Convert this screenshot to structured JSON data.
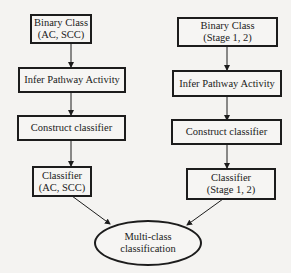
{
  "diagram": {
    "type": "flowchart",
    "left_column": {
      "binary_class": {
        "line1": "Binary Class",
        "line2": "(AC, SCC)"
      },
      "infer": {
        "label": "Infer Pathway Activity"
      },
      "construct": {
        "label": "Construct classifier"
      },
      "classifier": {
        "line1": "Classifier",
        "line2": "(AC, SCC)"
      }
    },
    "right_column": {
      "binary_class": {
        "line1": "Binary Class",
        "line2": "(Stage 1, 2)"
      },
      "infer": {
        "label": "Infer Pathway Activity"
      },
      "construct": {
        "label": "Construct classifier"
      },
      "classifier": {
        "line1": "Classifier",
        "line2": "(Stage 1, 2)"
      }
    },
    "output": {
      "line1": "Multi-class",
      "line2": "classification"
    },
    "edges": [
      {
        "from": "left_binary_class",
        "to": "left_infer"
      },
      {
        "from": "left_infer",
        "to": "left_construct"
      },
      {
        "from": "left_construct",
        "to": "left_classifier"
      },
      {
        "from": "left_classifier",
        "to": "output"
      },
      {
        "from": "right_binary_class",
        "to": "right_infer"
      },
      {
        "from": "right_infer",
        "to": "right_construct"
      },
      {
        "from": "right_construct",
        "to": "right_classifier"
      },
      {
        "from": "right_classifier",
        "to": "output"
      }
    ]
  }
}
